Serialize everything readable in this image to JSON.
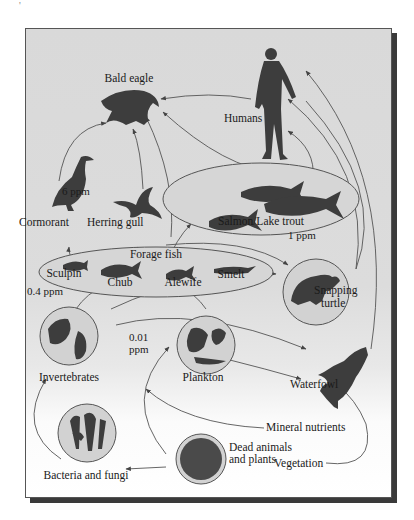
{
  "figure": {
    "corner_mark": "'",
    "organisms": {
      "bald_eagle": "Bald eagle",
      "humans": "Humans",
      "cormorant": "Cormorant",
      "herring_gull": "Herring gull",
      "salmon_lake_trout": "Salmon/Lake trout",
      "forage_fish": "Forage fish",
      "sculpin": "Sculpin",
      "chub": "Chub",
      "alewife": "Alewife",
      "smelt": "Smelt",
      "snapping_turtle_line1": "Snapping",
      "snapping_turtle_line2": "turtle",
      "invertebrates": "Invertebrates",
      "plankton": "Plankton",
      "waterfowl": "Waterfowl",
      "mineral_nutrients": "Mineral nutrients",
      "dead_line1": "Dead animals",
      "dead_line2": "and plants",
      "vegetation": "Vegetation",
      "bacteria_fungi": "Bacteria and fungi"
    },
    "concentrations": {
      "birds": "6 ppm",
      "salmon": "1 ppm",
      "forage_fish": "0.4 ppm",
      "invertebrates_line1": "0.01",
      "invertebrates_line2": "ppm"
    },
    "colors": {
      "background": "#d9d9d9",
      "silhouette": "#3d3d3d",
      "circle_fill": "#d2d2d2",
      "line": "#444444",
      "shadow": "#3a3a3a"
    }
  }
}
